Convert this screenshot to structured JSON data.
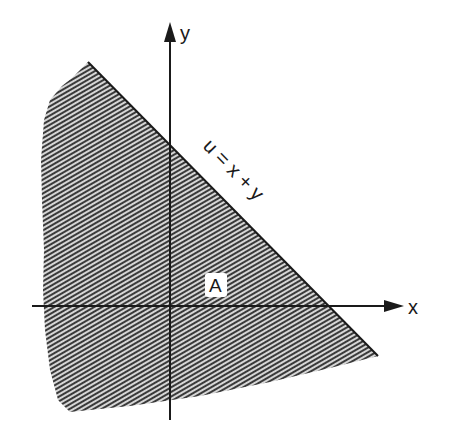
{
  "diagram": {
    "type": "region-in-plane",
    "axes": {
      "x_label": "x",
      "y_label": "y"
    },
    "boundary_line": {
      "label": "u = x + y",
      "equation": "x + y = u"
    },
    "region": {
      "label": "A",
      "description": "Shaded half-plane below the line x + y = u"
    },
    "colors": {
      "hatch_dark": "#2b2b2b",
      "hatch_light": "#d9d9d9",
      "axis": "#1a1a1a",
      "background": "#ffffff"
    }
  }
}
